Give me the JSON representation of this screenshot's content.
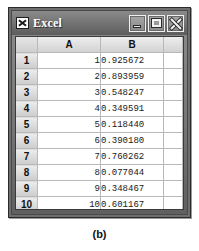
{
  "window": {
    "title": "Excel",
    "icon": "excel-icon",
    "controls": [
      {
        "name": "minimize",
        "label": "Minimize"
      },
      {
        "name": "maximize",
        "label": "Maximize"
      },
      {
        "name": "close",
        "label": "Close"
      }
    ]
  },
  "spreadsheet": {
    "corner_label": "",
    "column_headers": [
      "A",
      "B",
      ""
    ],
    "row_headers": [
      "1",
      "2",
      "3",
      "4",
      "5",
      "6",
      "7",
      "8",
      "9",
      "10",
      "11"
    ],
    "rows": [
      {
        "header": "1",
        "a": "1",
        "b": "0.925672",
        "c": ""
      },
      {
        "header": "2",
        "a": "2",
        "b": "0.893959",
        "c": ""
      },
      {
        "header": "3",
        "a": "3",
        "b": "0.548247",
        "c": ""
      },
      {
        "header": "4",
        "a": "4",
        "b": "0.349591",
        "c": ""
      },
      {
        "header": "5",
        "a": "5",
        "b": "0.118440",
        "c": ""
      },
      {
        "header": "6",
        "a": "6",
        "b": "0.390180",
        "c": ""
      },
      {
        "header": "7",
        "a": "7",
        "b": "0.760262",
        "c": ""
      },
      {
        "header": "8",
        "a": "8",
        "b": "0.077044",
        "c": ""
      },
      {
        "header": "9",
        "a": "9",
        "b": "0.348467",
        "c": ""
      },
      {
        "header": "10",
        "a": "10",
        "b": "0.601167",
        "c": ""
      },
      {
        "header": "11",
        "a": "",
        "b": "",
        "c": ""
      }
    ]
  },
  "caption": {
    "label": "(b)"
  },
  "colors": {
    "titlebar": "#6f6f6f",
    "frame": "#2b2b2b",
    "header_cell": "#d2d2d2",
    "grid_line": "#b9b9b9",
    "cell_background": "#ffffff",
    "title_text": "#ffffff"
  }
}
